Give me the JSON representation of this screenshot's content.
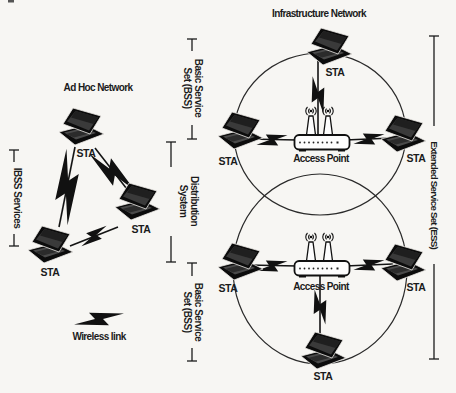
{
  "figure": {
    "background_color": "#f7f6f3",
    "ink_color": "#1b1b1b"
  },
  "titles": {
    "ad_hoc": "Ad Hoc Network",
    "infrastructure": "Infrastructure Network"
  },
  "labels": {
    "station": "STA",
    "access_point": "Access Point",
    "wireless_link": "Wireless link"
  },
  "brackets": {
    "ibss": "IBSS Services",
    "bss_top": {
      "line1": "Basic Service",
      "line2": "Set (BSS)"
    },
    "distribution": {
      "line1": "Distribution",
      "line2": "System"
    },
    "bss_bottom": {
      "line1": "Basic Service",
      "line2": "Set (BSS)"
    },
    "ess": "Extended Service Set (ESS)"
  }
}
